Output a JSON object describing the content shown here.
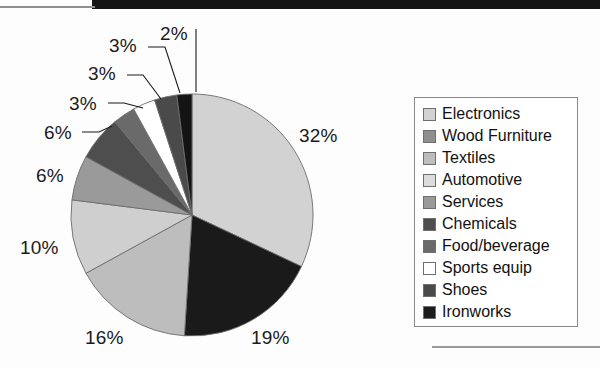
{
  "chart_data": {
    "type": "pie",
    "title": "",
    "categories": [
      "Electronics",
      "Wood Furniture",
      "Textiles",
      "Automotive",
      "Services",
      "Chemicals",
      "Food/beverage",
      "Sports equip",
      "Shoes",
      "Ironworks"
    ],
    "values": [
      32,
      19,
      16,
      10,
      6,
      6,
      3,
      3,
      3,
      2
    ],
    "value_labels": [
      "32%",
      "19%",
      "16%",
      "10%",
      "6%",
      "6%",
      "3%",
      "3%",
      "3%",
      "2%"
    ],
    "unit": "%",
    "slice_colors": [
      "#d2d2d2",
      "#1a1a1a",
      "#bdbdbd",
      "#cfcfcf",
      "#9a9a9a",
      "#4e4e4e",
      "#6a6a6a",
      "#ffffff",
      "#4a4a4a",
      "#141414"
    ],
    "start_angle_deg": 0,
    "direction": "clockwise",
    "legend_position": "right",
    "grid": false
  },
  "legend": {
    "items": [
      {
        "label": "Electronics",
        "color": "#d2d2d2"
      },
      {
        "label": "Wood Furniture",
        "color": "#8f8f8f"
      },
      {
        "label": "Textiles",
        "color": "#bdbdbd"
      },
      {
        "label": "Automotive",
        "color": "#dcdcdc"
      },
      {
        "label": "Services",
        "color": "#9a9a9a"
      },
      {
        "label": "Chemicals",
        "color": "#4e4e4e"
      },
      {
        "label": "Food/beverage",
        "color": "#6a6a6a"
      },
      {
        "label": "Sports equip",
        "color": "#ffffff"
      },
      {
        "label": "Shoes",
        "color": "#4a4a4a"
      },
      {
        "label": "Ironworks",
        "color": "#1c1c1c"
      }
    ]
  },
  "pie_labels": [
    {
      "text": "32%",
      "left": 299,
      "top": 125
    },
    {
      "text": "19%",
      "left": 251,
      "top": 327
    },
    {
      "text": "16%",
      "left": 85,
      "top": 327
    },
    {
      "text": "10%",
      "left": 20,
      "top": 237
    },
    {
      "text": "6%",
      "left": 36,
      "top": 165
    },
    {
      "text": "6%",
      "left": 44,
      "top": 122
    },
    {
      "text": "3%",
      "left": 69,
      "top": 93
    },
    {
      "text": "3%",
      "left": 88,
      "top": 63
    },
    {
      "text": "3%",
      "left": 109,
      "top": 35
    },
    {
      "text": "2%",
      "left": 160,
      "top": 23
    }
  ]
}
